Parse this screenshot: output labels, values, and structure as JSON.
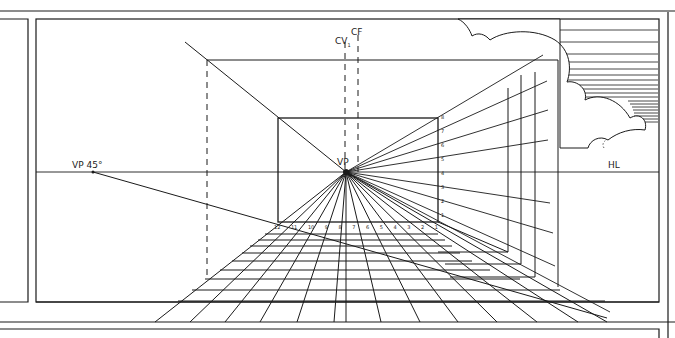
{
  "diagram": {
    "type": "one-point perspective construction",
    "labels": {
      "vp": "VP",
      "vp45": "VP 45°",
      "cv": "CV",
      "cv_sub": "1",
      "cf": "CF",
      "hl": "HL"
    },
    "base_numbers": [
      "12",
      "11",
      "10",
      "9",
      "8",
      "7",
      "6",
      "5",
      "4",
      "3",
      "2",
      "1"
    ],
    "wall_numbers": [
      "8",
      "7",
      "6",
      "5",
      "4",
      "3",
      "2",
      "1"
    ],
    "colors": {
      "ink": "#1a1a1a",
      "paper": "#ffffff"
    }
  }
}
